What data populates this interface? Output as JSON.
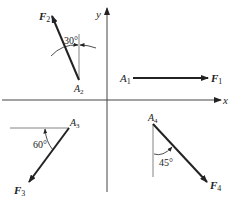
{
  "diagram": {
    "axes": {
      "x_label": "x",
      "y_label": "y"
    },
    "forces": [
      {
        "id": "F1",
        "point_label": "A",
        "point_sub": "1",
        "force_label": "F",
        "force_sub": "1",
        "direction": "along +x axis",
        "angle_label": ""
      },
      {
        "id": "F2",
        "point_label": "A",
        "point_sub": "2",
        "force_label": "F",
        "force_sub": "2",
        "direction": "up-left, 30° from vertical",
        "angle_label": "30°"
      },
      {
        "id": "F3",
        "point_label": "A",
        "point_sub": "3",
        "force_label": "F",
        "force_sub": "3",
        "direction": "down-left, 60° from horizontal",
        "angle_label": "60°"
      },
      {
        "id": "F4",
        "point_label": "A",
        "point_sub": "4",
        "force_label": "F",
        "force_sub": "4",
        "direction": "down-right, 45° from vertical",
        "angle_label": "45°"
      }
    ],
    "colors": {
      "line": "#222222",
      "thin_line": "#555555",
      "background": "#ffffff"
    }
  }
}
